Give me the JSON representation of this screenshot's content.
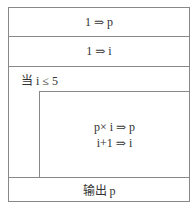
{
  "diagram": {
    "type": "N-S flowchart",
    "steps": [
      {
        "label": "1 ⇒ p"
      },
      {
        "label": "1 ⇒ i"
      }
    ],
    "loop": {
      "condition": "当 i ≤ 5",
      "body": [
        "p× i ⇒ p",
        "i+1 ⇒ i"
      ]
    },
    "output": "输出 p"
  }
}
